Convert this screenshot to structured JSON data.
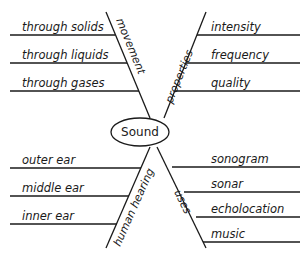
{
  "diagram": {
    "type": "fishbone-web",
    "center": {
      "label": "Sound"
    },
    "branches": [
      {
        "category": "movement",
        "position": "top-left",
        "items": [
          "through solids",
          "through liquids",
          "through gases"
        ]
      },
      {
        "category": "properties",
        "position": "top-right",
        "items": [
          "intensity",
          "frequency",
          "quality"
        ]
      },
      {
        "category": "human hearing",
        "position": "bottom-left",
        "items": [
          "outer ear",
          "middle ear",
          "inner ear"
        ]
      },
      {
        "category": "uses",
        "position": "bottom-right",
        "items": [
          "sonogram",
          "sonar",
          "echolocation",
          "music"
        ]
      }
    ],
    "colors": {
      "line": "#1a1a1a",
      "background": "#ffffff"
    }
  }
}
